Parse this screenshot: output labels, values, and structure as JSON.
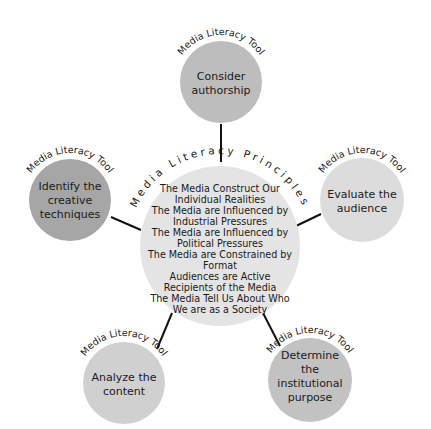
{
  "diagram": {
    "colors": {
      "background": "#ffffff",
      "center_fill": "#e4e4e4",
      "satellite_light": "#d9d9d9",
      "satellite_mid": "#bdbdbd",
      "satellite_dark": "#a6a6a6",
      "connector": "#111111",
      "text": "#1a1a1a"
    },
    "center": {
      "arc_label": "Media Literacy Principles",
      "principles": [
        "The Media Construct Our",
        "Individual Realities",
        "The Media are Influenced by",
        "Industrial Pressures",
        "The Media are Influenced by",
        "Political Pressures",
        "The Media are Constrained by",
        "Format",
        "Audiences are Active",
        "Recipients of the Media",
        "The Media Tell Us About Who",
        "We are as a Society"
      ]
    },
    "tools": [
      {
        "arc_label": "Media Literacy Tool",
        "lines": [
          "Consider",
          "authorship"
        ]
      },
      {
        "arc_label": "Media Literacy Tool",
        "lines": [
          "Identify the",
          "creative",
          "techniques"
        ]
      },
      {
        "arc_label": "Media Literacy Tool",
        "lines": [
          "Evaluate the",
          "audience"
        ]
      },
      {
        "arc_label": "Media Literacy Tool",
        "lines": [
          "Analyze the",
          "content"
        ]
      },
      {
        "arc_label": "Media Literacy Tool",
        "lines": [
          "Determine",
          "the",
          "institutional",
          "purpose"
        ]
      }
    ]
  }
}
